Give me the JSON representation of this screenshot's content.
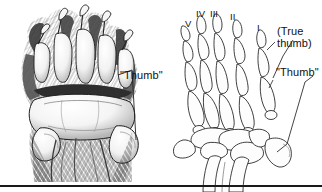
{
  "figure": {
    "type": "two-panel scientific illustration",
    "background_color": "#ffffff",
    "ink_color": "#111111",
    "bottom_rule_color": "#1a1a1a"
  },
  "left_panel": {
    "name": "panda-paw-drawing",
    "description": "stippled ink drawing of a giant panda forepaw showing pads, claws and fur",
    "label": "\"Thumb\"",
    "label_x": 120,
    "label_y": 70
  },
  "right_panel": {
    "name": "hand-skeleton-drawing",
    "description": "line drawing of hand skeleton with phalanges, metacarpals, carpals, radius and ulna",
    "digit_labels": [
      {
        "text": "V",
        "x": 185,
        "y": 18
      },
      {
        "text": "IV",
        "x": 196,
        "y": 8
      },
      {
        "text": "III",
        "x": 209,
        "y": 8
      },
      {
        "text": "II",
        "x": 229,
        "y": 11
      },
      {
        "text": "I",
        "x": 256,
        "y": 22
      }
    ],
    "true_thumb_label_line1": "(True",
    "true_thumb_label_line2": "thumb)",
    "true_thumb_label_x": 277,
    "true_thumb_label_y": 25,
    "thumb_label": "\"Thumb\"",
    "thumb_label_x": 276,
    "thumb_label_y": 67
  }
}
